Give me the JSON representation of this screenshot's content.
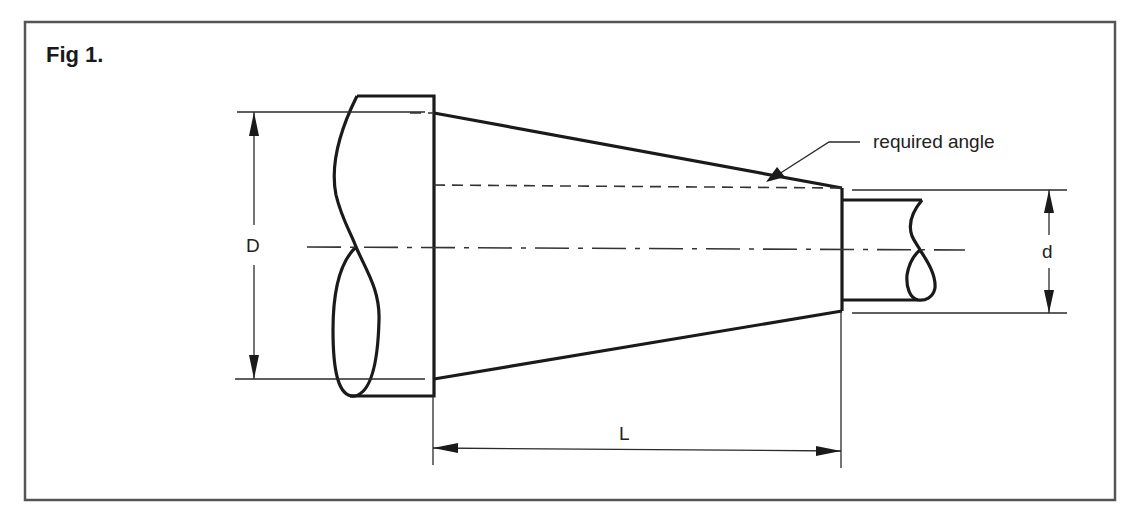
{
  "figure": {
    "title": "Fig 1.",
    "colors": {
      "line": "#1a1a1a",
      "frame": "#555555",
      "background": "#ffffff"
    },
    "labels": {
      "large_diameter": "D",
      "small_diameter": "d",
      "taper_length": "L",
      "angle_callout": "required angle"
    },
    "line_types": {
      "outline": "thick solid",
      "dimension": "thin solid with arrowheads",
      "centerline": "dash-dot",
      "reference": "dashed"
    }
  }
}
